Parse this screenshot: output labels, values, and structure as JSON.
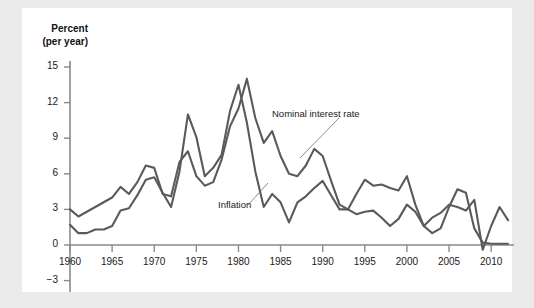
{
  "figure": {
    "background_color": "#ebebeb",
    "panel_color": "#ffffff",
    "line_color": "#5a5a5a",
    "axis_color": "#8a8a8a"
  },
  "axis": {
    "y_title_line1": "Percent",
    "y_title_line2": "(per year)",
    "y_ticks": [
      "15",
      "12",
      "9",
      "6",
      "3",
      "0",
      "−3"
    ],
    "x_ticks": [
      "1960",
      "1965",
      "1970",
      "1975",
      "1980",
      "1985",
      "1990",
      "1995",
      "2000",
      "2005",
      "2010"
    ]
  },
  "annotations": {
    "nominal_label": "Nominal interest rate",
    "inflation_label": "Inflation"
  },
  "chart_data": {
    "type": "line",
    "title": "",
    "xlabel": "",
    "ylabel": "Percent (per year)",
    "xlim": [
      1960,
      2012
    ],
    "ylim": [
      -3,
      15
    ],
    "grid": false,
    "legend": "inline-annotations",
    "x": [
      1960,
      1961,
      1962,
      1963,
      1964,
      1965,
      1966,
      1967,
      1968,
      1969,
      1970,
      1971,
      1972,
      1973,
      1974,
      1975,
      1976,
      1977,
      1978,
      1979,
      1980,
      1981,
      1982,
      1983,
      1984,
      1985,
      1986,
      1987,
      1988,
      1989,
      1990,
      1991,
      1992,
      1993,
      1994,
      1995,
      1996,
      1997,
      1998,
      1999,
      2000,
      2001,
      2002,
      2003,
      2004,
      2005,
      2006,
      2007,
      2008,
      2009,
      2010,
      2011,
      2012
    ],
    "series": [
      {
        "name": "Nominal interest rate",
        "values": [
          3.0,
          2.4,
          2.8,
          3.2,
          3.6,
          4.0,
          4.9,
          4.3,
          5.3,
          6.7,
          6.5,
          4.3,
          4.1,
          7.0,
          7.9,
          5.8,
          5.0,
          5.3,
          7.2,
          10.0,
          11.5,
          14.0,
          10.7,
          8.6,
          9.6,
          7.5,
          6.0,
          5.8,
          6.7,
          8.1,
          7.5,
          5.4,
          3.4,
          3.0,
          4.3,
          5.5,
          5.0,
          5.1,
          4.8,
          4.6,
          5.8,
          3.4,
          1.6,
          1.0,
          1.4,
          3.2,
          4.7,
          4.4,
          1.4,
          0.2,
          0.1,
          0.1,
          0.1
        ]
      },
      {
        "name": "Inflation",
        "values": [
          1.7,
          1.0,
          1.0,
          1.3,
          1.3,
          1.6,
          2.9,
          3.1,
          4.2,
          5.5,
          5.7,
          4.4,
          3.2,
          6.2,
          11.0,
          9.1,
          5.8,
          6.5,
          7.6,
          11.3,
          13.5,
          10.3,
          6.2,
          3.2,
          4.3,
          3.6,
          1.9,
          3.6,
          4.1,
          4.8,
          5.4,
          4.2,
          3.0,
          3.0,
          2.6,
          2.8,
          2.9,
          2.3,
          1.6,
          2.2,
          3.4,
          2.8,
          1.6,
          2.3,
          2.7,
          3.4,
          3.2,
          2.9,
          3.8,
          -0.4,
          1.6,
          3.2,
          2.1
        ]
      }
    ]
  }
}
